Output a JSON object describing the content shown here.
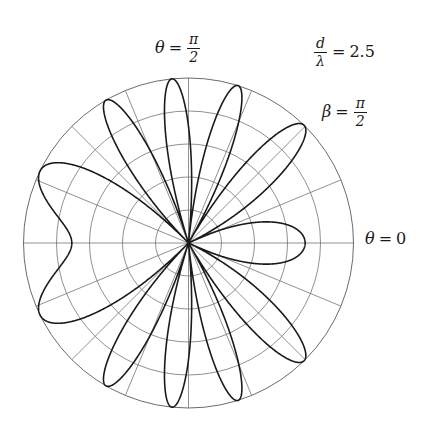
{
  "figure": {
    "kind": "polar-radiation-pattern",
    "background": "#ffffff",
    "ink": "#1a1a1a",
    "grid_color": "#6b6b6b",
    "curve_color": "#1a1a1a"
  },
  "annotations": {
    "theta_top": {
      "var": "θ",
      "eq": "=",
      "num": "π",
      "den": "2"
    },
    "d_over_lambda": {
      "num": "d",
      "den": "λ",
      "eq": "=",
      "value": "2.5"
    },
    "beta": {
      "var": "β",
      "eq": "=",
      "num": "π",
      "den": "2"
    },
    "theta_zero": {
      "var": "θ",
      "eq": "=",
      "value": "0"
    }
  },
  "chart_data": {
    "type": "line",
    "subtype": "polar",
    "title": "",
    "xlabel": "",
    "ylabel": "",
    "formula": "r(theta) = |cos( pi*(d/lambda)*cos(theta) + beta/2 )|",
    "parameters": {
      "d_over_lambda": 2.5,
      "beta_over_pi": 0.5,
      "beta_radians": 1.5707963268
    },
    "theta_range_deg": [
      0,
      360
    ],
    "theta_zero_direction": "east",
    "theta_positive_direction": "counterclockwise",
    "rlim": [
      0,
      1
    ],
    "grid": true,
    "grid_rings": 5,
    "grid_ring_radii": [
      0.2,
      0.4,
      0.6,
      0.8,
      1.0
    ],
    "grid_spokes": 16,
    "grid_spoke_step_deg": 22.5,
    "legend": "none",
    "lobe_count": 10,
    "lobe_peak_angles_deg": [
      10.4,
      42.8,
      66.4,
      87.1,
      107.5,
      129.4,
      157.6,
      202.4,
      230.6,
      252.5,
      272.9,
      293.6,
      317.2,
      349.6
    ],
    "samples": 4000,
    "axis_labels": {
      "east": "theta = 0",
      "north": "theta = pi/2"
    }
  }
}
